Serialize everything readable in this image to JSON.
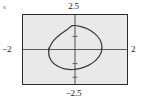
{
  "figure": {
    "title": "",
    "frame_color": "#2b2b2b",
    "plot_background": "#e9e9e9",
    "curve_color": "#3a3a3a",
    "axis_color": "#555555"
  },
  "labels": {
    "y_max": "2.5",
    "y_min": "−2.5",
    "x_min": "−2",
    "x_max": "2"
  },
  "chart_data": {
    "type": "line",
    "title": "",
    "xlabel": "",
    "ylabel": "",
    "xlim": [
      -2,
      2
    ],
    "ylim": [
      -2.5,
      2.5
    ],
    "grid": false,
    "legend": null,
    "axes": {
      "x_axis_at_y": 0,
      "y_axis_at_x": 0,
      "x_tick_values": [
        -2,
        2
      ],
      "y_tick_values": [
        -2.5,
        2.5
      ],
      "minor_ticks_visible": true
    },
    "series": [
      {
        "name": "tilted ellipse",
        "shape": "ellipse",
        "center": [
          0.1,
          0.05
        ],
        "semi_major": 1.55,
        "semi_minor": 0.85,
        "rotation_deg": -38,
        "points": [
          [
            -0.09,
            1.73
          ],
          [
            0.23,
            1.66
          ],
          [
            0.53,
            1.45
          ],
          [
            0.77,
            1.13
          ],
          [
            0.95,
            0.74
          ],
          [
            1.03,
            0.31
          ],
          [
            1.02,
            -0.12
          ],
          [
            0.92,
            -0.52
          ],
          [
            0.74,
            -0.88
          ],
          [
            0.5,
            -1.17
          ],
          [
            0.21,
            -1.37
          ],
          [
            -0.1,
            -1.45
          ],
          [
            -0.4,
            -1.4
          ],
          [
            -0.66,
            -1.22
          ],
          [
            -0.86,
            -0.93
          ],
          [
            -0.98,
            -0.56
          ],
          [
            -1.01,
            -0.15
          ],
          [
            -0.95,
            0.28
          ],
          [
            -0.8,
            0.7
          ],
          [
            -0.57,
            1.09
          ],
          [
            -0.3,
            1.45
          ],
          [
            -0.09,
            1.73
          ]
        ]
      }
    ]
  }
}
